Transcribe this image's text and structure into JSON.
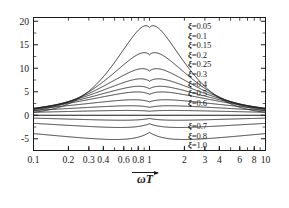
{
  "chart_data": {
    "type": "line",
    "title": "",
    "xlabel": "ωT",
    "xlabel_symbol": "ωT",
    "xlabel_has_vector_arrow": true,
    "ylabel": "",
    "xscale": "log",
    "xlim": [
      0.1,
      10
    ],
    "ylim": [
      -7.5,
      20.8
    ],
    "grid": false,
    "legend_position": "inside-right",
    "xticks": [
      0.1,
      0.2,
      0.3,
      0.4,
      0.6,
      0.8,
      1,
      2,
      3,
      4,
      6,
      8,
      10
    ],
    "xtick_labels": [
      "0.1",
      "0.2",
      "0.3",
      "0.4",
      "0.6",
      "0.8",
      "1",
      "2",
      "3",
      "4",
      "6",
      "8",
      "10"
    ],
    "yticks": [
      -5,
      0,
      5,
      10,
      15,
      20
    ],
    "ytick_labels": [
      "-5",
      "0",
      "5",
      "10",
      "15",
      "20"
    ],
    "series_symbol": "ξ",
    "series": [
      {
        "name": "ξ=0.05",
        "zeta": 0.05,
        "peak_value": 20.0
      },
      {
        "name": "ξ=0.1",
        "zeta": 0.1,
        "peak_value": 14.0
      },
      {
        "name": "ξ=0.15",
        "zeta": 0.15,
        "peak_value": 10.4
      },
      {
        "name": "ξ=0.2",
        "zeta": 0.2,
        "peak_value": 8.1
      },
      {
        "name": "ξ=0.25",
        "zeta": 0.25,
        "peak_value": 6.4
      },
      {
        "name": "ξ=0.3",
        "zeta": 0.3,
        "peak_value": 5.1
      },
      {
        "name": "ξ=0.4",
        "zeta": 0.4,
        "peak_value": 3.3
      },
      {
        "name": "ξ=0.5",
        "zeta": 0.5,
        "peak_value": 1.9
      },
      {
        "name": "ξ=0.6",
        "zeta": 0.6,
        "peak_value": 0.8
      },
      {
        "name": "ξ=0.7",
        "zeta": 0.7,
        "peak_value": -1.5
      },
      {
        "name": "ξ=0.8",
        "zeta": 0.8,
        "peak_value": -3.2
      },
      {
        "name": "ξ=1.0",
        "zeta": 1.0,
        "peak_value": -6.0
      }
    ]
  },
  "legend_top": [
    {
      "label": "ξ=0.05"
    },
    {
      "label": "ξ=0.1"
    },
    {
      "label": "ξ=0.15"
    },
    {
      "label": "ξ=0.2"
    },
    {
      "label": "ξ=0.25"
    },
    {
      "label": "ξ=0.3"
    },
    {
      "label": "ξ=0.4"
    },
    {
      "label": "ξ=0.5"
    },
    {
      "label": "ξ=0.6"
    }
  ],
  "legend_bottom": [
    {
      "label": "ξ=0.7"
    },
    {
      "label": "ξ=0.8"
    },
    {
      "label": "ξ=1.0"
    }
  ],
  "colors": {
    "background": "#ffffff",
    "axis": "#1a1a1a",
    "curve": "#1a1a1a"
  }
}
